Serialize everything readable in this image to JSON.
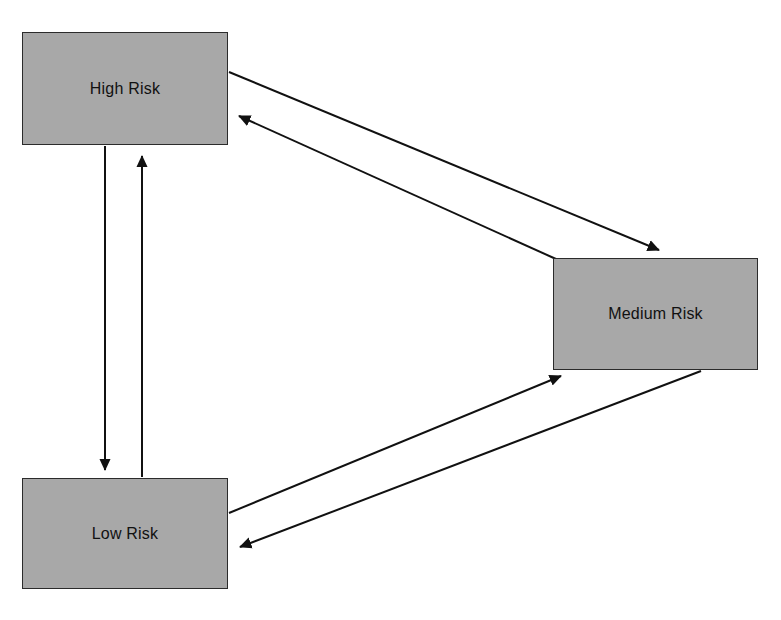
{
  "diagram": {
    "type": "state-transition-diagram",
    "background_color": "#ffffff",
    "node_fill_color": "#a8a8a8",
    "node_border_color": "#2b2b2b",
    "edge_color": "#111111",
    "nodes": [
      {
        "id": "high",
        "label": "High Risk",
        "x": 22,
        "y": 32,
        "width": 206,
        "height": 113
      },
      {
        "id": "medium",
        "label": "Medium Risk",
        "x": 553,
        "y": 258,
        "width": 205,
        "height": 112
      },
      {
        "id": "low",
        "label": "Low Risk",
        "x": 22,
        "y": 478,
        "width": 206,
        "height": 111
      }
    ],
    "edges": [
      {
        "id": "high-to-low",
        "from": "high",
        "to": "low",
        "label": "",
        "points": "105,146 105,470"
      },
      {
        "id": "low-to-high",
        "from": "low",
        "to": "high",
        "label": "",
        "points": "142,477 142,156"
      },
      {
        "id": "high-to-medium",
        "from": "high",
        "to": "medium",
        "label": "",
        "points": "229,72 659,250"
      },
      {
        "id": "medium-to-high",
        "from": "medium",
        "to": "high",
        "label": "",
        "points": "556,259 239,116"
      },
      {
        "id": "low-to-medium",
        "from": "low",
        "to": "medium",
        "label": "",
        "points": "229,513 561,376"
      },
      {
        "id": "medium-to-low",
        "from": "medium",
        "to": "low",
        "label": "",
        "points": "701,371 240,547"
      }
    ]
  }
}
